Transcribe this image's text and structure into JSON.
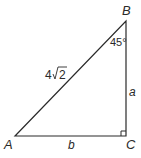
{
  "diagram": {
    "type": "right-triangle",
    "vertices": {
      "A": {
        "label": "A"
      },
      "B": {
        "label": "B"
      },
      "C": {
        "label": "C"
      }
    },
    "sides": {
      "hypotenuse_AB": {
        "label_coef": "4",
        "label_radicand": "2"
      },
      "side_BC": {
        "label": "a"
      },
      "side_AC": {
        "label": "b"
      }
    },
    "angles": {
      "B": {
        "label": "45°"
      },
      "C": {
        "right_angle": true
      }
    },
    "colors": {
      "stroke": "#2a2a2a",
      "background": "#ffffff"
    }
  }
}
